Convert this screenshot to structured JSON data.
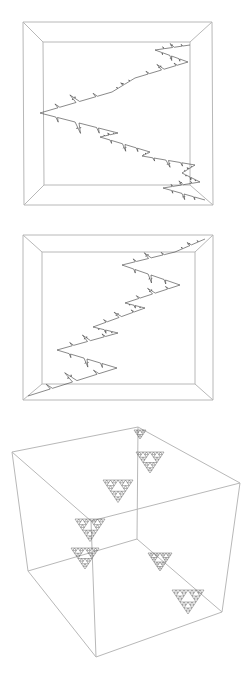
{
  "figure": {
    "panels": [
      {
        "id": "panel-1",
        "type": "box-perspective-front",
        "outer": [
          [
            23,
            22
          ],
          [
            212,
            22
          ],
          [
            213,
            205
          ],
          [
            24,
            205
          ]
        ],
        "inner": [
          [
            43,
            42
          ],
          [
            190,
            42
          ],
          [
            190,
            185
          ],
          [
            44,
            185
          ]
        ],
        "curve_key_points": [
          [
            190,
            45
          ],
          [
            155,
            50
          ],
          [
            188,
            62
          ],
          [
            135,
            78
          ],
          [
            112,
            92
          ],
          [
            40,
            113
          ],
          [
            118,
            133
          ],
          [
            100,
            137
          ],
          [
            150,
            152
          ],
          [
            142,
            156
          ],
          [
            195,
            165
          ],
          [
            182,
            173
          ],
          [
            200,
            182
          ],
          [
            163,
            188
          ],
          [
            205,
            200
          ]
        ],
        "curve_style": "zigzag-fractal"
      },
      {
        "id": "panel-2",
        "type": "box-perspective-front",
        "outer": [
          [
            23,
            235
          ],
          [
            213,
            235
          ],
          [
            213,
            400
          ],
          [
            23,
            400
          ]
        ],
        "inner": [
          [
            42,
            252
          ],
          [
            195,
            252
          ],
          [
            195,
            384
          ],
          [
            42,
            384
          ]
        ],
        "curve_key_points": [
          [
            205,
            239
          ],
          [
            175,
            252
          ],
          [
            122,
            265
          ],
          [
            180,
            285
          ],
          [
            125,
            303
          ],
          [
            145,
            308
          ],
          [
            93,
            327
          ],
          [
            118,
            333
          ],
          [
            57,
            350
          ],
          [
            117,
            368
          ],
          [
            28,
            396
          ]
        ],
        "curve_style": "zigzag-fractal"
      },
      {
        "id": "panel-3",
        "type": "cube-3d",
        "vertices": {
          "top_left": [
            12,
            452
          ],
          "top_back": [
            138,
            427
          ],
          "top_right": [
            240,
            483
          ],
          "top_front": [
            91,
            521
          ],
          "bottom_left": [
            28,
            571
          ],
          "bottom_back": [
            137,
            539
          ],
          "bottom_right": [
            222,
            612
          ],
          "bottom_front": [
            96,
            657
          ]
        },
        "sierpinski_triangles": [
          {
            "apex": [
              140,
              430
            ],
            "size": 12,
            "depth": 2
          },
          {
            "apex": [
              150,
              452
            ],
            "size": 28,
            "depth": 3
          },
          {
            "apex": [
              118,
              480
            ],
            "size": 30,
            "depth": 3
          },
          {
            "apex": [
              90,
              519
            ],
            "size": 30,
            "depth": 3
          },
          {
            "apex": [
              85,
              548
            ],
            "size": 28,
            "depth": 3
          },
          {
            "apex": [
              160,
              553
            ],
            "size": 24,
            "depth": 3
          },
          {
            "apex": [
              188,
              590
            ],
            "size": 32,
            "depth": 3
          }
        ]
      }
    ]
  }
}
